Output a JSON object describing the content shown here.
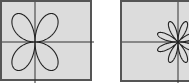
{
  "chart_data": [
    {
      "type": "line",
      "subtype": "polar-rose",
      "title": "",
      "equation": "r = sin(2θ)",
      "petals": 4,
      "xlabel": "",
      "ylabel": "",
      "axes_visible": true,
      "grid": false,
      "panel_background": "#dcdcdc",
      "curve_color": "#222222"
    },
    {
      "type": "line",
      "subtype": "polar-rose",
      "title": "",
      "equation": "r = sin(4θ)",
      "petals": 8,
      "xlabel": "",
      "ylabel": "",
      "axes_visible": true,
      "grid": false,
      "panel_background": "#dcdcdc",
      "curve_color": "#222222"
    }
  ],
  "panels": {
    "left": {
      "cx": 33,
      "cy": 40,
      "rx": 30,
      "ry": 37,
      "k": 2
    },
    "right": {
      "cx": 56,
      "cy": 40,
      "rx": 22,
      "ry": 22,
      "k": 4
    }
  }
}
